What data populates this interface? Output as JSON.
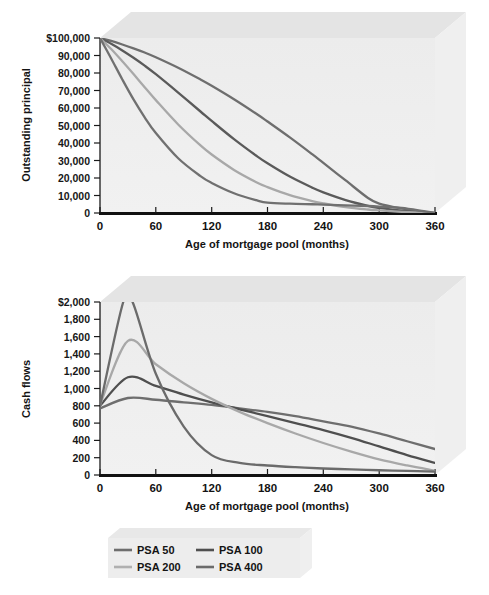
{
  "chart_data": [
    {
      "type": "line",
      "id": "outstanding-principal",
      "title": "",
      "xlabel": "Age of mortgage pool (months)",
      "ylabel": "Outstanding principal",
      "xlim": [
        0,
        360
      ],
      "ylim": [
        0,
        100000
      ],
      "xticks": [
        0,
        60,
        120,
        180,
        240,
        300,
        360
      ],
      "xtick_labels": [
        "0",
        "60",
        "120",
        "180",
        "240",
        "300",
        "360"
      ],
      "yticks": [
        0,
        10000,
        20000,
        30000,
        40000,
        50000,
        60000,
        70000,
        80000,
        90000,
        100000
      ],
      "ytick_labels": [
        "0",
        "10,000",
        "20,000",
        "30,000",
        "40,000",
        "50,000",
        "60,000",
        "70,000",
        "80,000",
        "90,000",
        "$100,000"
      ],
      "grid": false,
      "legend_position": "below-figure",
      "series": [
        {
          "name": "PSA 50",
          "color": "#6e6e6e",
          "x": [
            0,
            12,
            24,
            36,
            48,
            60,
            84,
            108,
            120,
            144,
            168,
            180,
            204,
            228,
            240,
            264,
            288,
            300,
            324,
            348,
            360
          ],
          "values": [
            100000,
            98300,
            96300,
            94100,
            91700,
            89000,
            83000,
            76300,
            72700,
            65000,
            56700,
            52300,
            43200,
            33600,
            28600,
            18600,
            8600,
            5400,
            2600,
            600,
            0
          ]
        },
        {
          "name": "PSA 100",
          "color": "#5a5a5a",
          "x": [
            0,
            12,
            24,
            36,
            48,
            60,
            84,
            108,
            120,
            144,
            168,
            180,
            204,
            228,
            240,
            264,
            288,
            300,
            324,
            348,
            360
          ],
          "values": [
            100000,
            96700,
            92900,
            88700,
            84200,
            79300,
            68800,
            58000,
            52600,
            42200,
            32700,
            28400,
            20800,
            14500,
            11800,
            7400,
            4100,
            2900,
            1300,
            200,
            0
          ]
        },
        {
          "name": "PSA 200",
          "color": "#a8a8a8",
          "x": [
            0,
            12,
            24,
            36,
            48,
            60,
            84,
            108,
            120,
            144,
            168,
            180,
            204,
            228,
            240,
            264,
            288,
            300,
            324,
            348,
            360
          ],
          "values": [
            100000,
            93700,
            86700,
            79400,
            71900,
            64500,
            50600,
            38600,
            33400,
            24600,
            17600,
            14800,
            10200,
            6800,
            5500,
            3400,
            2000,
            1500,
            700,
            100,
            0
          ]
        },
        {
          "name": "PSA 400",
          "color": "#707070",
          "x": [
            0,
            12,
            24,
            36,
            48,
            60,
            84,
            108,
            120,
            144,
            168,
            180,
            204,
            228,
            240,
            264,
            288,
            300,
            324,
            348,
            360
          ],
          "values": [
            100000,
            88300,
            76300,
            64900,
            54700,
            45700,
            31300,
            21100,
            17200,
            11300,
            7300,
            5900,
            5300,
            5000,
            4800,
            4400,
            4000,
            3700,
            2900,
            1000,
            0
          ]
        }
      ]
    },
    {
      "type": "line",
      "id": "cash-flows",
      "title": "",
      "xlabel": "Age of mortgage pool (months)",
      "ylabel": "Cash flows",
      "xlim": [
        0,
        360
      ],
      "ylim": [
        0,
        2000
      ],
      "xticks": [
        0,
        60,
        120,
        180,
        240,
        300,
        360
      ],
      "xtick_labels": [
        "0",
        "60",
        "120",
        "180",
        "240",
        "300",
        "360"
      ],
      "yticks": [
        0,
        200,
        400,
        600,
        800,
        1000,
        1200,
        1400,
        1600,
        1800,
        2000
      ],
      "ytick_labels": [
        "0",
        "200",
        "400",
        "600",
        "800",
        "1,000",
        "1,200",
        "1,400",
        "1,600",
        "1,800",
        "$2,000"
      ],
      "grid": false,
      "legend_position": "below-figure",
      "note": "PSA 400 peak is clipped above the $2,000 axis maximum",
      "series": [
        {
          "name": "PSA 50",
          "color": "#6e6e6e",
          "x": [
            0,
            30,
            60,
            90,
            120,
            150,
            180,
            210,
            240,
            270,
            300,
            330,
            360
          ],
          "values": [
            770,
            890,
            870,
            840,
            810,
            770,
            730,
            680,
            620,
            560,
            480,
            390,
            300
          ]
        },
        {
          "name": "PSA 100",
          "color": "#4f4f4f",
          "x": [
            0,
            30,
            60,
            90,
            120,
            150,
            180,
            210,
            240,
            270,
            300,
            330,
            360
          ],
          "values": [
            800,
            1130,
            1030,
            930,
            840,
            760,
            680,
            600,
            520,
            430,
            330,
            230,
            140
          ]
        },
        {
          "name": "PSA 200",
          "color": "#a8a8a8",
          "x": [
            0,
            30,
            60,
            90,
            120,
            150,
            180,
            210,
            240,
            270,
            300,
            330,
            360
          ],
          "values": [
            810,
            1550,
            1280,
            1060,
            880,
            730,
            600,
            480,
            370,
            270,
            180,
            110,
            50
          ]
        },
        {
          "name": "PSA 400",
          "color": "#6b6b6b",
          "x": [
            0,
            25,
            35,
            60,
            90,
            120,
            150,
            180,
            210,
            240,
            270,
            300,
            330,
            360
          ],
          "values": [
            800,
            2000,
            2000,
            1170,
            560,
            230,
            140,
            110,
            90,
            75,
            65,
            55,
            48,
            40
          ]
        }
      ]
    }
  ],
  "legend": {
    "entries": [
      {
        "label": "PSA 50",
        "color": "#6e6e6e"
      },
      {
        "label": "PSA 100",
        "color": "#4f4f4f"
      },
      {
        "label": "PSA 200",
        "color": "#b0b0b0"
      },
      {
        "label": "PSA 400",
        "color": "#6b6b6b"
      }
    ]
  },
  "colors": {
    "plot_face": "#eeeeee",
    "box_top": "#e3e3e3",
    "box_right": "#efefef",
    "axis": "#1a1a1a",
    "baseline": "#111111"
  }
}
